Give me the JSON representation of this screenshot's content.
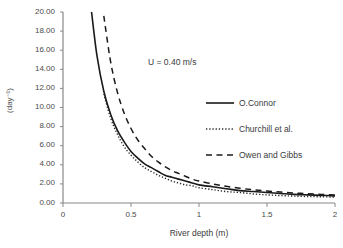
{
  "chart_data": {
    "type": "line",
    "title": "",
    "xlabel": "River depth (m)",
    "ylabel": "(day⁻¹)",
    "xlim": [
      0,
      2
    ],
    "ylim": [
      0,
      20
    ],
    "grid": false,
    "legend_position": "inside-right",
    "annotations": [
      {
        "text": "U = 0.40 m/s",
        "x": 0.95,
        "y": 15.2
      }
    ],
    "xticks": [
      "0",
      "0.5",
      "1",
      "1.5",
      "2"
    ],
    "xtick_values": [
      0,
      0.5,
      1,
      1.5,
      2
    ],
    "yticks": [
      "0.00",
      "2.00",
      "4.00",
      "6.00",
      "8.00",
      "10.00",
      "12.00",
      "14.00",
      "16.00",
      "18.00",
      "20.00"
    ],
    "ytick_values": [
      0,
      2,
      4,
      6,
      8,
      10,
      12,
      14,
      16,
      18,
      20
    ],
    "x": [
      0.21,
      0.25,
      0.3,
      0.35,
      0.4,
      0.45,
      0.5,
      0.55,
      0.6,
      0.65,
      0.7,
      0.75,
      0.8,
      0.85,
      0.9,
      0.95,
      1.0,
      1.1,
      1.2,
      1.3,
      1.4,
      1.5,
      1.6,
      1.7,
      1.8,
      1.9,
      2.0
    ],
    "series": [
      {
        "name": "O.Connor",
        "style": "solid",
        "color": "#1a1a1a",
        "x": [
          0.21,
          0.25,
          0.3,
          0.35,
          0.4,
          0.45,
          0.5,
          0.55,
          0.6,
          0.65,
          0.7,
          0.75,
          0.8,
          0.85,
          0.9,
          0.95,
          1.0,
          1.1,
          1.2,
          1.3,
          1.4,
          1.5,
          1.6,
          1.7,
          1.8,
          1.9,
          2.0
        ],
        "values": [
          20.0,
          15.4,
          11.7,
          9.3,
          7.6,
          6.4,
          5.4,
          4.7,
          4.1,
          3.7,
          3.3,
          2.9,
          2.7,
          2.5,
          2.3,
          2.1,
          1.9,
          1.7,
          1.5,
          1.3,
          1.2,
          1.1,
          1.0,
          0.9,
          0.85,
          0.8,
          0.75
        ],
        "description": "k = C * U^0.5 * H^-1.5"
      },
      {
        "name": "Churchill et al.",
        "style": "dotted",
        "color": "#2a2a2a",
        "x": [
          0.3,
          0.35,
          0.4,
          0.45,
          0.5,
          0.55,
          0.6,
          0.65,
          0.7,
          0.75,
          0.8,
          0.85,
          0.9,
          0.95,
          1.0,
          1.1,
          1.2,
          1.3,
          1.4,
          1.5,
          1.6,
          1.7,
          1.8,
          1.9,
          2.0
        ],
        "values": [
          11.4,
          8.9,
          7.2,
          5.9,
          5.0,
          4.3,
          3.7,
          3.3,
          2.9,
          2.6,
          2.3,
          2.1,
          1.9,
          1.8,
          1.6,
          1.4,
          1.2,
          1.1,
          0.95,
          0.85,
          0.78,
          0.72,
          0.68,
          0.65,
          0.62
        ],
        "description": "k = C * U^0.969 * H^-1.673"
      },
      {
        "name": "Owen and Gibbs",
        "style": "dashed",
        "color": "#1a1a1a",
        "x": [
          0.3,
          0.35,
          0.4,
          0.45,
          0.5,
          0.55,
          0.6,
          0.65,
          0.7,
          0.75,
          0.8,
          0.85,
          0.9,
          0.95,
          1.0,
          1.1,
          1.2,
          1.3,
          1.4,
          1.5,
          1.6,
          1.7,
          1.8,
          1.9,
          2.0
        ],
        "values": [
          19.6,
          14.8,
          11.6,
          9.4,
          7.8,
          6.6,
          5.7,
          4.9,
          4.3,
          3.8,
          3.4,
          3.1,
          2.8,
          2.5,
          2.3,
          2.0,
          1.75,
          1.55,
          1.38,
          1.25,
          1.14,
          1.05,
          0.97,
          0.9,
          0.85
        ],
        "description": "k = C * U^0.67 * H^-1.85"
      }
    ]
  },
  "legend": {
    "items": [
      {
        "label": "O.Connor",
        "style": "solid"
      },
      {
        "label": "Churchill et al.",
        "style": "dotted"
      },
      {
        "label": "Owen and Gibbs",
        "style": "dashed"
      }
    ]
  },
  "axes": {
    "x_title": "River depth (m)",
    "y_title": "(day⁻¹)"
  },
  "colors": {
    "background": "#ffffff",
    "axis": "#808080",
    "text": "#3a3a3a",
    "curve": "#1a1a1a"
  }
}
